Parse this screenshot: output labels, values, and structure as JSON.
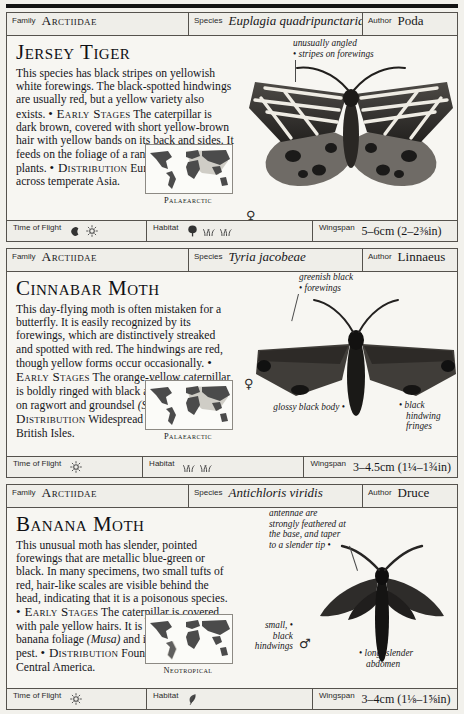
{
  "labels": {
    "family": "Family",
    "species": "Species",
    "author": "Author",
    "time_of_flight": "Time of Flight",
    "habitat": "Habitat",
    "wingspan": "Wingspan"
  },
  "entries": [
    {
      "family": "Arctiidae",
      "species": "Euplagia quadripunctaria",
      "author": "Poda",
      "title": "Jersey Tiger",
      "description_parts": [
        {
          "type": "text",
          "text": "This species has black stripes on yellowish white forewings. The black-spotted hindwings are usually red, but a yellow variety also exists. "
        },
        {
          "type": "heading",
          "text": "• Early Stages"
        },
        {
          "type": "text",
          "text": " The caterpillar is dark brown, covered with short yellow-brown hair with yellow bands on its back and sides. It feeds on the foliage of a range of low-growing plants. "
        },
        {
          "type": "heading",
          "text": "• Distribution"
        },
        {
          "type": "text",
          "text": " Europe, extending across temperate Asia."
        }
      ],
      "map_caption": "Palaearctic",
      "map_region": "palaearctic",
      "sex_symbol": "♀",
      "annotations": [
        {
          "name": "forewing-stripes-annotation",
          "lines": [
            "unusually angled",
            "stripes on forewings"
          ]
        }
      ],
      "time_of_flight_icons": [
        "moon-icon",
        "sun-icon"
      ],
      "habitat_icons": [
        "tree-icon",
        "grass-icon",
        "grass-icon"
      ],
      "wingspan": "5–6cm (2–2⅜in)"
    },
    {
      "family": "Arctiidae",
      "species": "Tyria jacobeae",
      "author": "Linnaeus",
      "title": "Cinnabar Moth",
      "description_parts": [
        {
          "type": "text",
          "text": "This day-flying moth is often mistaken for a butterfly. It is easily recognized by its forewings, which are distinctively streaked and spotted with red. The hindwings are red, though yellow forms occur occasionally. "
        },
        {
          "type": "heading",
          "text": "• Early Stages"
        },
        {
          "type": "text",
          "text": " The orange-yellow caterpillar is boldly ringed with black and feeds openly on ragwort and groundsel "
        },
        {
          "type": "italic",
          "text": "(Senecio)"
        },
        {
          "type": "text",
          "text": ". "
        },
        {
          "type": "heading",
          "text": "• Distribution"
        },
        {
          "type": "text",
          "text": " Widespread in Europe and the British Isles."
        }
      ],
      "map_caption": "Palaearctic",
      "map_region": "palaearctic",
      "sex_symbol": "♀",
      "annotations": [
        {
          "name": "forewing-color-annotation",
          "lines": [
            "greenish black",
            "forewings"
          ]
        },
        {
          "name": "body-annotation",
          "lines": [
            "glossy black body"
          ]
        },
        {
          "name": "hindwing-fringe-annotation",
          "lines": [
            "black",
            "hindwing",
            "fringes"
          ]
        }
      ],
      "time_of_flight_icons": [
        "sun-icon"
      ],
      "habitat_icons": [
        "grass-icon",
        "grass-icon"
      ],
      "wingspan": "3–4.5cm (1¼–1¾in)"
    },
    {
      "family": "Arctiidae",
      "species": "Antichloris viridis",
      "author": "Druce",
      "title": "Banana Moth",
      "description_parts": [
        {
          "type": "text",
          "text": "This unusual moth has slender, pointed forewings that are metallic blue-green or black. In many specimens, two small tufts of red, hair-like scales are visible behind the head, indicating that it is a poisonous species. "
        },
        {
          "type": "heading",
          "text": "• Early Stages"
        },
        {
          "type": "text",
          "text": " The caterpillar is covered with pale yellow hairs. It is known to feed on banana foliage "
        },
        {
          "type": "italic",
          "text": "(Musa)"
        },
        {
          "type": "text",
          "text": " and is regarded as a pest. "
        },
        {
          "type": "heading",
          "text": "• Distribution"
        },
        {
          "type": "text",
          "text": " Found in South and Central America."
        }
      ],
      "map_caption": "Neotropical",
      "map_region": "neotropical",
      "sex_symbol": "♂",
      "annotations": [
        {
          "name": "antennae-annotation",
          "lines": [
            "antennae are",
            "strongly feathered at",
            "the base, and taper",
            "to a slender tip"
          ]
        },
        {
          "name": "hindwings-annotation",
          "lines": [
            "small,",
            "black",
            "hindwings"
          ]
        },
        {
          "name": "abdomen-annotation",
          "lines": [
            "long, slender",
            "abdomen"
          ]
        }
      ],
      "time_of_flight_icons": [
        "sun-icon"
      ],
      "habitat_icons": [
        "leaf-icon"
      ],
      "wingspan": "3–4cm (1⅛–1⅝in)"
    }
  ]
}
